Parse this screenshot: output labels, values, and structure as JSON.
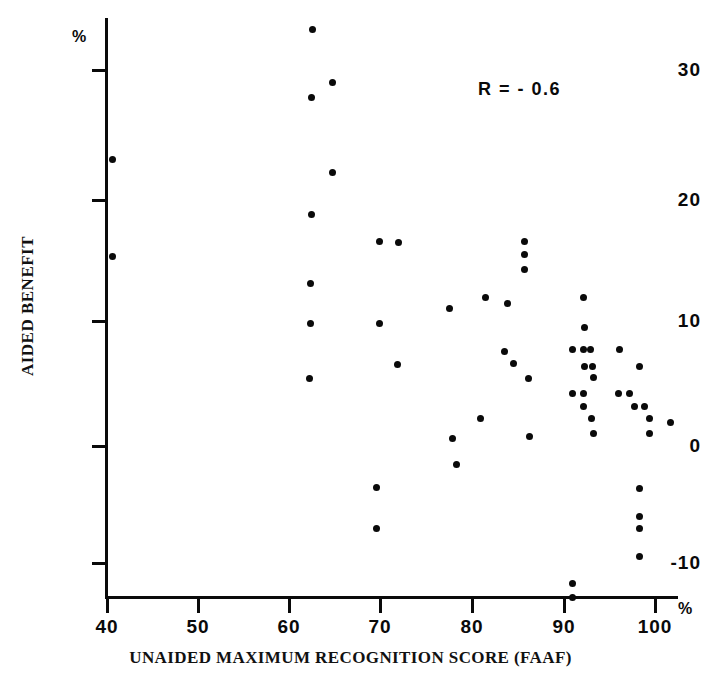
{
  "figure": {
    "width": 701,
    "height": 694,
    "background": "#ffffff",
    "ink_color": "#0a0a0a"
  },
  "axes": {
    "x_unit_symbol": "%",
    "y_unit_symbol": "%",
    "x_tick_labels": [
      "40",
      "50",
      "60",
      "70",
      "80",
      "90",
      "100"
    ],
    "y_tick_labels": [
      "30",
      "20",
      "10",
      "0",
      "-10"
    ]
  },
  "annotation": {
    "correlation_label": "R = - 0.6"
  },
  "chart_data": {
    "type": "scatter",
    "title": "",
    "xlabel": "UNAIDED MAXIMUM RECOGNITION SCORE (FAAF)",
    "ylabel": "AIDED BENEFIT",
    "x_unit": "%",
    "y_unit": "%",
    "xlim": [
      40,
      103
    ],
    "ylim": [
      -13,
      33
    ],
    "xticks": [
      40,
      50,
      60,
      70,
      80,
      90,
      100
    ],
    "yticks": [
      30,
      20,
      10,
      0,
      -10
    ],
    "grid": false,
    "legend": null,
    "annotations": [
      {
        "text": "R = - 0.6",
        "x": 91,
        "y": 29.5
      }
    ],
    "series": [
      {
        "name": "subjects",
        "marker": "filled-circle",
        "color": "#0a0a0a",
        "points": [
          [
            40.6,
            22.9
          ],
          [
            40.6,
            15.2
          ],
          [
            62.5,
            33.3
          ],
          [
            64.7,
            29.1
          ],
          [
            62.4,
            27.9
          ],
          [
            64.7,
            21.9
          ],
          [
            62.4,
            18.5
          ],
          [
            62.3,
            13.0
          ],
          [
            69.9,
            16.4
          ],
          [
            72.0,
            16.3
          ],
          [
            62.3,
            9.8
          ],
          [
            69.9,
            9.8
          ],
          [
            71.9,
            6.5
          ],
          [
            62.2,
            5.4
          ],
          [
            77.6,
            11.0
          ],
          [
            81.5,
            11.9
          ],
          [
            83.9,
            11.4
          ],
          [
            85.8,
            16.4
          ],
          [
            85.8,
            15.3
          ],
          [
            85.8,
            14.1
          ],
          [
            83.6,
            7.6
          ],
          [
            84.6,
            6.6
          ],
          [
            86.2,
            5.4
          ],
          [
            92.3,
            11.9
          ],
          [
            92.4,
            9.5
          ],
          [
            81.0,
            2.2
          ],
          [
            77.9,
            0.6
          ],
          [
            78.3,
            -1.5
          ],
          [
            86.3,
            0.8
          ],
          [
            91.0,
            7.7
          ],
          [
            92.3,
            7.7
          ],
          [
            93.0,
            7.7
          ],
          [
            96.2,
            7.7
          ],
          [
            92.4,
            6.4
          ],
          [
            93.2,
            6.4
          ],
          [
            98.4,
            6.4
          ],
          [
            93.3,
            5.5
          ],
          [
            91.0,
            4.2
          ],
          [
            92.2,
            4.2
          ],
          [
            96.1,
            4.2
          ],
          [
            97.3,
            4.2
          ],
          [
            92.3,
            3.2
          ],
          [
            97.8,
            3.2
          ],
          [
            98.9,
            3.2
          ],
          [
            93.1,
            2.2
          ],
          [
            99.5,
            2.2
          ],
          [
            93.3,
            1.0
          ],
          [
            99.5,
            1.0
          ],
          [
            98.4,
            -3.4
          ],
          [
            98.4,
            -5.6
          ],
          [
            98.4,
            -6.6
          ],
          [
            98.4,
            -8.8
          ],
          [
            69.6,
            -3.3
          ],
          [
            69.6,
            -6.6
          ],
          [
            91.0,
            -11.0
          ],
          [
            91.0,
            -12.1
          ],
          [
            101.8,
            1.9
          ]
        ]
      }
    ]
  }
}
